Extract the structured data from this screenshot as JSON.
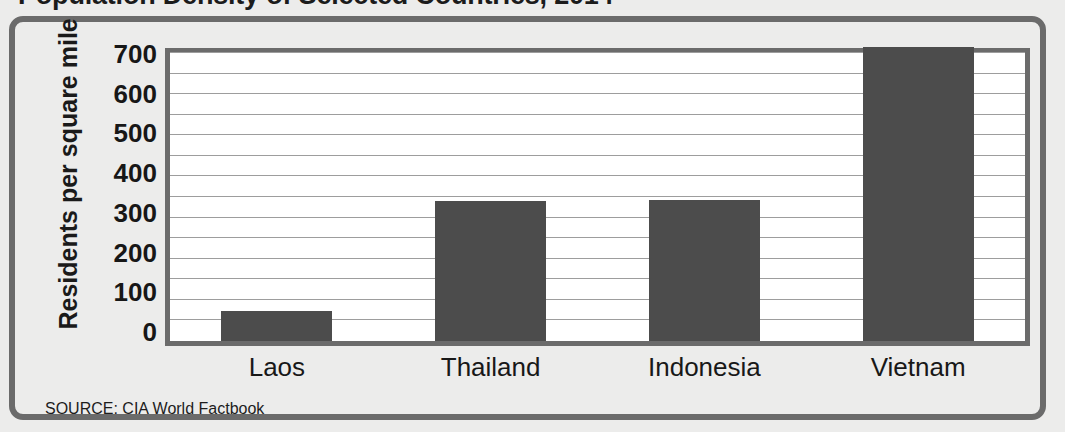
{
  "chart_data": {
    "type": "bar",
    "title": "Population Density of Selected Countries, 2014",
    "xlabel": "",
    "ylabel": "Residents per square mile",
    "categories": [
      "Laos",
      "Thailand",
      "Indonesia",
      "Vietnam"
    ],
    "values": [
      74,
      340,
      342,
      715
    ],
    "ylim": [
      0,
      700
    ],
    "ytick_labels": [
      "700",
      "600",
      "500",
      "400",
      "300",
      "200",
      "100",
      "0"
    ],
    "ytick_values": [
      700,
      600,
      500,
      400,
      300,
      200,
      100,
      0
    ],
    "grid": true,
    "grid_minor_step": 50,
    "legend": null,
    "source": "SOURCE: CIA World Factbook",
    "bar_color": "#4c4c4c",
    "plot_background": "#ffffff",
    "frame_color": "#6b6b6b",
    "page_background": "#ececeb"
  }
}
